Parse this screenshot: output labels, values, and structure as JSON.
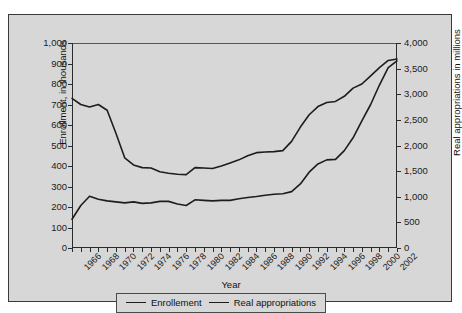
{
  "chart_data": {
    "type": "line",
    "title": "",
    "xlabel": "Year",
    "ylabel": "Enrollment, in thousands",
    "y2label": "Real appropriations in millions",
    "xlim": [
      1966,
      2003
    ],
    "ylim": [
      0,
      1000
    ],
    "y2lim": [
      0,
      4000
    ],
    "grid": false,
    "legend_position": "bottom-center",
    "yticks": [
      "1,000",
      "900",
      "800",
      "700",
      "600",
      "500",
      "400",
      "300",
      "200",
      "100",
      "0"
    ],
    "ytick_values": [
      1000,
      900,
      800,
      700,
      600,
      500,
      400,
      300,
      200,
      100,
      0
    ],
    "y2ticks": [
      "4,000",
      "3,500",
      "3,000",
      "2,500",
      "2,000",
      "1,500",
      "1,000",
      "500",
      "0"
    ],
    "y2tick_values": [
      4000,
      3500,
      3000,
      2500,
      2000,
      1500,
      1000,
      500,
      0
    ],
    "xticks": [
      "1966",
      "1968",
      "1970",
      "1972",
      "1974",
      "1976",
      "1978",
      "1980",
      "1982",
      "1984",
      "1986",
      "1988",
      "1990",
      "1992",
      "1994",
      "1996",
      "1998",
      "2000",
      "2002"
    ],
    "xtick_values": [
      1966,
      1968,
      1970,
      1972,
      1974,
      1976,
      1978,
      1980,
      1982,
      1984,
      1986,
      1988,
      1990,
      1992,
      1994,
      1996,
      1998,
      2000,
      2002
    ],
    "x": [
      1966,
      1967,
      1968,
      1969,
      1970,
      1971,
      1972,
      1973,
      1974,
      1975,
      1976,
      1977,
      1978,
      1979,
      1980,
      1981,
      1982,
      1983,
      1984,
      1985,
      1986,
      1987,
      1988,
      1989,
      1990,
      1991,
      1992,
      1993,
      1994,
      1995,
      1996,
      1997,
      1998,
      1999,
      2000,
      2001,
      2002,
      2003
    ],
    "series": [
      {
        "name": "Enrollement",
        "axis": "left",
        "unit": "thousands",
        "values": [
          730,
          700,
          688,
          700,
          672,
          560,
          440,
          405,
          392,
          390,
          372,
          365,
          360,
          358,
          392,
          390,
          388,
          400,
          415,
          430,
          450,
          465,
          468,
          470,
          475,
          520,
          590,
          650,
          690,
          710,
          715,
          740,
          780,
          800,
          840,
          880,
          915,
          922
        ]
      },
      {
        "name": "Real appropriations",
        "axis": "right",
        "unit": "millions",
        "values": [
          560,
          830,
          1010,
          950,
          920,
          900,
          880,
          900,
          870,
          880,
          910,
          910,
          860,
          830,
          940,
          930,
          920,
          930,
          930,
          960,
          985,
          1005,
          1030,
          1050,
          1060,
          1100,
          1250,
          1480,
          1640,
          1720,
          1730,
          1900,
          2150,
          2480,
          2800,
          3180,
          3520,
          3650
        ]
      }
    ]
  },
  "legend": {
    "items": [
      {
        "label": "Enrollement"
      },
      {
        "label": "Real appropriations"
      }
    ]
  }
}
